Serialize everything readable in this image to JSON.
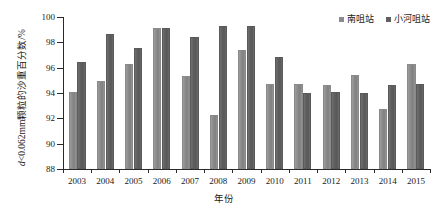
{
  "chart_data": {
    "type": "bar",
    "title": "",
    "xlabel": "年份",
    "ylabel": "d<0.062mm颗粒的沙重百分数/%",
    "ylabel_italic_prefix": "d",
    "ylabel_rest": "<0.062mm颗粒的沙重百分数/%",
    "categories": [
      "2003",
      "2004",
      "2005",
      "2006",
      "2007",
      "2008",
      "2009",
      "2010",
      "2011",
      "2012",
      "2013",
      "2014",
      "2015"
    ],
    "ylim": [
      88,
      100
    ],
    "yticks": [
      88,
      90,
      92,
      94,
      96,
      98,
      100
    ],
    "grid": false,
    "legend_position": "top-right",
    "series": [
      {
        "name": "南咀站",
        "color": "#8b8b8b",
        "values": [
          94.1,
          94.95,
          96.3,
          99.1,
          95.35,
          92.3,
          97.4,
          94.75,
          94.75,
          94.65,
          95.45,
          92.75,
          96.3
        ]
      },
      {
        "name": "小河咀站",
        "color": "#5f5f5f",
        "values": [
          96.45,
          98.65,
          97.55,
          99.1,
          98.45,
          99.3,
          99.3,
          96.85,
          94.0,
          94.1,
          94.0,
          94.65,
          94.75
        ]
      }
    ]
  },
  "legend": {
    "items": [
      {
        "label": "南咀站"
      },
      {
        "label": "小河咀站"
      }
    ]
  },
  "axes": {
    "x_title": "年份",
    "y_title_italic": "d",
    "y_title_rest": "<0.062mm颗粒的沙重百分数/%"
  }
}
